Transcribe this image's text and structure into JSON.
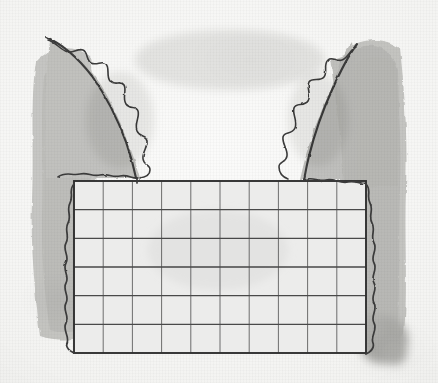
{
  "image": {
    "title": "Hand-drawn pencil and grey wash sketch",
    "subject": "Two curved wing-like forms with scalloped inner edges flanking a ruled rectangular grid",
    "medium": "pencil line and grey watercolour wash on textured paper",
    "canvas": {
      "width": 438,
      "height": 383
    }
  },
  "colors": {
    "paper": "#f4f4f2",
    "paper_highlight": "#fbfbfa",
    "wash_light": "#d8d8d6",
    "wash_mid": "#c4c4c2",
    "wash_dark": "#b0b0ae",
    "ink": "#3a3a3a",
    "grid_line": "#4a4a4a",
    "grid_border": "#2f2f2f",
    "grid_fill": "#ececeb"
  },
  "grid": {
    "label": "ruled rectangle",
    "columns": 10,
    "rows": 6,
    "x": 74,
    "y": 181,
    "width": 292,
    "height": 172,
    "cell_width": 29.2,
    "cell_height": 28.7
  },
  "shapes": [
    {
      "name": "left-wing",
      "side": "left",
      "apex_x": 48,
      "apex_y": 36,
      "base_y": 182
    },
    {
      "name": "right-wing",
      "side": "right",
      "apex_x": 352,
      "apex_y": 40,
      "base_y": 182
    },
    {
      "name": "left-wash-band",
      "x": 33,
      "y": 40,
      "width": 62,
      "height": 300
    },
    {
      "name": "right-wash-band",
      "x": 340,
      "y": 34,
      "width": 70,
      "height": 310
    },
    {
      "name": "corner-blot",
      "x": 360,
      "y": 318,
      "width": 50,
      "height": 50
    }
  ]
}
